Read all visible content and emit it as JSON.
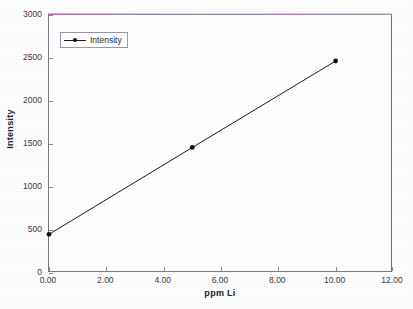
{
  "chart_data": {
    "type": "line",
    "title": "",
    "xlabel": "ppm Li",
    "ylabel": "Intensity",
    "xlim": [
      0,
      12
    ],
    "ylim": [
      0,
      3000
    ],
    "grid": false,
    "legend_position": "top-left",
    "x": [
      0.0,
      5.0,
      10.0
    ],
    "series": [
      {
        "name": "Intensity",
        "values": [
          450,
          1460,
          2465
        ],
        "marker": "filled-circle",
        "line_color": "#1a1a1a"
      }
    ],
    "xticks": [
      "0.00",
      "2.00",
      "4.00",
      "6.00",
      "8.00",
      "10.00",
      "12.00"
    ],
    "xtick_values": [
      0,
      2,
      4,
      6,
      8,
      10,
      12
    ],
    "yticks": [
      "0",
      "500",
      "1000",
      "1500",
      "2000",
      "2500",
      "3000"
    ],
    "ytick_values": [
      0,
      500,
      1000,
      1500,
      2000,
      2500,
      3000
    ]
  },
  "legend": {
    "entries": [
      {
        "label": "Intensity"
      }
    ]
  },
  "axes": {
    "x_title": "ppm Li",
    "y_title": "Intensity"
  }
}
